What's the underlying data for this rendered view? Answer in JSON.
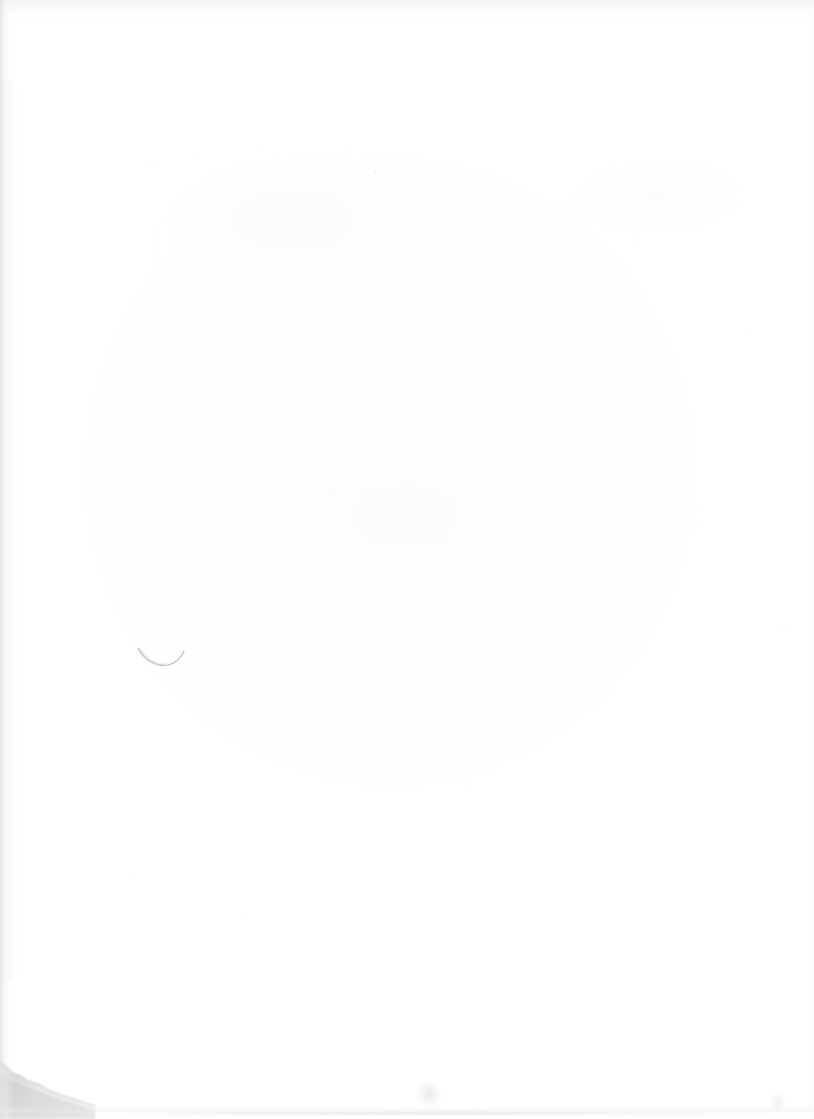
{
  "document": {
    "kind": "scanned-page",
    "title": "Blank scanned paper page",
    "width": 814,
    "height": 1119,
    "text_content": "",
    "notes": "No legible printed or handwritten text is present on the page."
  },
  "colors": {
    "paper": "#ffffff",
    "page_tone": "#fdfdfd",
    "edge_shadow": "#dee0e2",
    "corner_damage": "#c9cbcd",
    "pencil_mark": "#b9bcbe",
    "smudge": "#d0d2d4"
  },
  "marks": [
    {
      "id": "pencil-arc",
      "label": "Faint curved pencil stroke",
      "shape": "arc",
      "x": 140,
      "y": 648,
      "width": 44,
      "height": 18,
      "color": "#b9bcbe"
    },
    {
      "id": "corner-damage",
      "label": "Torn / shadowed bottom-left page corner",
      "shape": "irregular-region",
      "x": 0,
      "y": 1050,
      "width": 95,
      "height": 69,
      "color": "#c9cbcd"
    },
    {
      "id": "smudge-bottom-center",
      "label": "Faint smudge near bottom center",
      "shape": "blob",
      "x": 416,
      "y": 1082,
      "width": 26,
      "height": 26,
      "color": "#d0d2d4"
    },
    {
      "id": "smudge-bottom-right",
      "label": "Faint speck near bottom right",
      "shape": "blob",
      "x": 770,
      "y": 1092,
      "width": 16,
      "height": 20,
      "color": "#d8dadb"
    }
  ],
  "edges": {
    "left_shadow": "vertical gradient band along left margin",
    "top_shadow": "soft gray band along top margin",
    "right_shadow": "very faint band along right margin",
    "bottom_edge_line": "thin horizontal page-edge line near bottom"
  }
}
